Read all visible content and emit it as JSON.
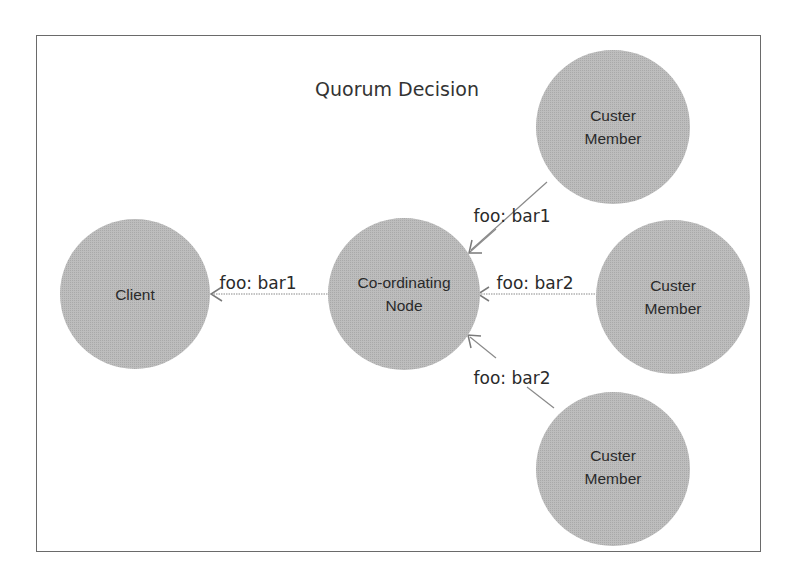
{
  "diagram": {
    "title": "Quorum Decision",
    "colors": {
      "node_fill": "#b8b8b8",
      "edge": "#7a7a7a",
      "frame": "#6a6a6a",
      "text": "#2a2a2a"
    },
    "nodes": [
      {
        "id": "client",
        "line1": "Client",
        "line2": ""
      },
      {
        "id": "coordinator",
        "line1": "Co-ordinating",
        "line2": "Node"
      },
      {
        "id": "member1",
        "line1": "Custer",
        "line2": "Member"
      },
      {
        "id": "member2",
        "line1": "Custer",
        "line2": "Member"
      },
      {
        "id": "member3",
        "line1": "Custer",
        "line2": "Member"
      }
    ],
    "edges": [
      {
        "from": "coordinator",
        "to": "client",
        "label": "foo: bar1"
      },
      {
        "from": "member1",
        "to": "coordinator",
        "label": "foo: bar1"
      },
      {
        "from": "member2",
        "to": "coordinator",
        "label": "foo: bar2"
      },
      {
        "from": "member3",
        "to": "coordinator",
        "label": "foo: bar2"
      }
    ]
  }
}
